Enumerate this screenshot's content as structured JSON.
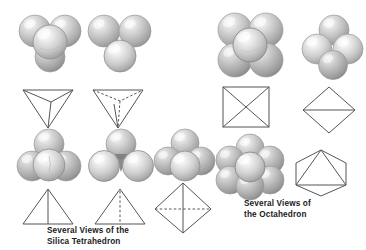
{
  "figure": {
    "background_color": "#ffffff",
    "line_color": "#4a4a4a",
    "sphere_base_color": "#b8b8b8",
    "sphere_highlight_color": "#f2f2f2",
    "sphere_shadow_color": "#8a8a8a",
    "captions": {
      "silica": "Several Views of the\nSilica Tetrahedron",
      "octahedron": "Several Views of\nthe Octahedron"
    },
    "groups": [
      {
        "id": "silica-tetrahedron",
        "label": "Several Views of the Silica Tetrahedron",
        "items": [
          {
            "id": "tetra-model-top-left",
            "kind": "sphere-cluster",
            "description": "Three spheres in triangular arrangement with one central sphere in front, apex down",
            "sphere_count": 4,
            "x": 18,
            "y": 12,
            "w": 66,
            "h": 62
          },
          {
            "id": "tetra-model-top-mid",
            "kind": "sphere-cluster",
            "description": "Two spheres on top, one sphere below center, showing a gap",
            "sphere_count": 3,
            "x": 88,
            "y": 12,
            "w": 66,
            "h": 62
          },
          {
            "id": "tetra-wire-top-left",
            "kind": "wireframe",
            "shape": "inverted-tetrahedron-solid-edges",
            "description": "Inverted tetrahedron outline with three solid edges meeting at bottom vertex",
            "x": 20,
            "y": 84,
            "w": 56,
            "h": 44
          },
          {
            "id": "tetra-wire-top-mid",
            "kind": "wireframe",
            "shape": "inverted-tetrahedron-dashed-hidden",
            "description": "Inverted tetrahedron outline with dashed hidden edges to rear vertex",
            "x": 90,
            "y": 84,
            "w": 56,
            "h": 44
          },
          {
            "id": "tetra-model-bottom-left",
            "kind": "sphere-cluster",
            "description": "Pyramid of spheres, one on top, two below, one in front center",
            "sphere_count": 4,
            "x": 16,
            "y": 128,
            "w": 66,
            "h": 56
          },
          {
            "id": "tetra-model-bottom-mid",
            "kind": "sphere-cluster",
            "description": "One sphere on top, two below side by side showing gap between",
            "sphere_count": 3,
            "x": 88,
            "y": 128,
            "w": 66,
            "h": 56
          },
          {
            "id": "tetra-model-bottom-right",
            "kind": "sphere-cluster",
            "description": "One sphere on top, two below, one in front, viewed edge on",
            "sphere_count": 4,
            "x": 154,
            "y": 128,
            "w": 62,
            "h": 56
          },
          {
            "id": "tetra-wire-bottom-left",
            "kind": "wireframe",
            "shape": "triangle-with-solid-median",
            "description": "Upright triangle with solid vertical median line",
            "x": 20,
            "y": 186,
            "w": 56,
            "h": 42
          },
          {
            "id": "tetra-wire-bottom-mid",
            "kind": "wireframe",
            "shape": "triangle-with-dashed-median",
            "description": "Upright triangle with dashed vertical median line",
            "x": 92,
            "y": 186,
            "w": 56,
            "h": 42
          },
          {
            "id": "tetra-wire-bottom-right",
            "kind": "wireframe",
            "shape": "rhombus-solid-vertical-dashed-horizontal",
            "description": "Diamond/rhombus with solid vertical axis and dashed horizontal axis",
            "x": 152,
            "y": 180,
            "w": 62,
            "h": 56
          }
        ]
      },
      {
        "id": "octahedron",
        "label": "Several Views of the Octahedron",
        "items": [
          {
            "id": "octa-model-top-left",
            "kind": "sphere-cluster",
            "description": "Four spheres in square arrangement with one central sphere in front",
            "sphere_count": 5,
            "x": 214,
            "y": 10,
            "w": 72,
            "h": 70
          },
          {
            "id": "octa-model-top-right",
            "kind": "sphere-cluster",
            "description": "Four spheres in diamond arrangement, one top, two middle, one bottom",
            "sphere_count": 4,
            "x": 302,
            "y": 14,
            "w": 64,
            "h": 66
          },
          {
            "id": "octa-wire-top-left",
            "kind": "wireframe",
            "shape": "square-with-both-diagonals",
            "description": "Square outline with both diagonals drawn",
            "x": 220,
            "y": 84,
            "w": 52,
            "h": 46
          },
          {
            "id": "octa-wire-top-right",
            "kind": "wireframe",
            "shape": "diamond-with-horizontal-axis",
            "description": "Diamond outline with horizontal line across the middle",
            "x": 300,
            "y": 84,
            "w": 58,
            "h": 50
          },
          {
            "id": "octa-model-bottom",
            "kind": "sphere-cluster",
            "description": "Six spheres in hexagonal ring with one sphere at center",
            "sphere_count": 7,
            "x": 216,
            "y": 134,
            "w": 68,
            "h": 64
          },
          {
            "id": "octa-wire-bottom",
            "kind": "wireframe",
            "shape": "hexagon-with-inscribed-triangle",
            "description": "Hexagon outline with inscribed triangle connecting alternate vertices",
            "x": 290,
            "y": 147,
            "w": 62,
            "h": 52
          }
        ]
      }
    ]
  }
}
